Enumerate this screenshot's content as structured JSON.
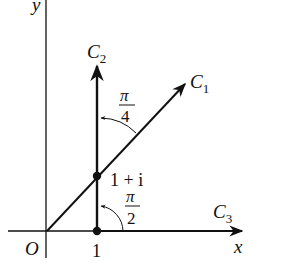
{
  "diagram": {
    "type": "complex-plane-paths",
    "axes": {
      "x_label": "x",
      "y_label": "y",
      "origin_label": "O",
      "tick_label_x": "1"
    },
    "curves": [
      {
        "id": "C1",
        "label_main": "C",
        "label_sub": "1",
        "description": "ray from origin at 45 degrees"
      },
      {
        "id": "C2",
        "label_main": "C",
        "label_sub": "2",
        "description": "vertical ray from 1"
      },
      {
        "id": "C3",
        "label_main": "C",
        "label_sub": "3",
        "description": "ray along positive real axis"
      }
    ],
    "points": [
      {
        "id": "p1",
        "label": "1"
      },
      {
        "id": "p1i",
        "label": "1 + i"
      }
    ],
    "angles": [
      {
        "id": "angle-pi-over-4",
        "numerator": "π",
        "denominator": "4"
      },
      {
        "id": "angle-pi-over-2",
        "numerator": "π",
        "denominator": "2"
      }
    ],
    "colors": {
      "ink": "#111111",
      "background": "#ffffff"
    }
  }
}
